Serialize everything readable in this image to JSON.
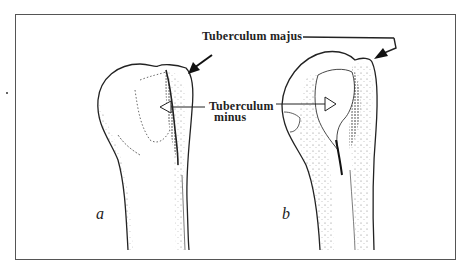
{
  "figure": {
    "type": "anatomical-line-drawing",
    "colors": {
      "ink": "#222222",
      "frame": "#555555",
      "background": "#ffffff"
    },
    "panels": [
      {
        "id": "a",
        "label": "a"
      },
      {
        "id": "b",
        "label": "b"
      }
    ],
    "annotations": {
      "tuberculum_majus": "Tuberculum majus",
      "tuberculum_minus_line1": "Tuberculum",
      "tuberculum_minus_line2": "minus"
    }
  }
}
